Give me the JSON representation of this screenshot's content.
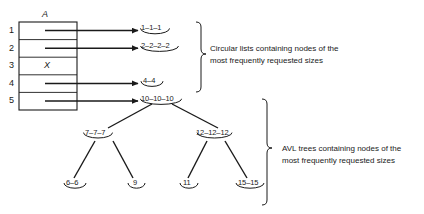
{
  "figure": {
    "array": {
      "name": "A",
      "row_indices": [
        "1",
        "2",
        "3",
        "4",
        "5"
      ],
      "occupied_marker": "X",
      "occupied_row": "3"
    },
    "circular_lists": [
      {
        "row": "1",
        "label": "1–1–1"
      },
      {
        "row": "2",
        "label": "2–2–2–2"
      },
      {
        "row": "4",
        "label": "4–4"
      },
      {
        "row": "5",
        "label": "10–10–10"
      }
    ],
    "avl_tree": {
      "root": {
        "label": "10–10–10"
      },
      "level2": [
        {
          "label": "7–7–7"
        },
        {
          "label": "12–12–12"
        }
      ],
      "leaves": [
        {
          "label": "6–6"
        },
        {
          "label": "9"
        },
        {
          "label": "11"
        },
        {
          "label": "15–15"
        }
      ]
    },
    "captions": {
      "circular": "Circular lists containing nodes of the\nmost frequently requested sizes",
      "avl": "AVL trees containing nodes of the\nmost frequently requested sizes"
    },
    "colors": {
      "stroke": "#1a1a1a",
      "text": "#1a1a1a",
      "background": "#ffffff"
    }
  }
}
